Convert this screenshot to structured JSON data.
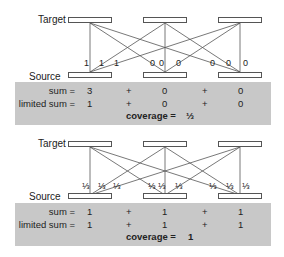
{
  "labels": {
    "target": "Target",
    "source": "Source",
    "sum": "sum =",
    "limited_sum": "limited sum =",
    "coverage": "coverage =",
    "plus": "+"
  },
  "panels": [
    {
      "weights": [
        "1",
        "1",
        "1",
        "0",
        "0",
        "0",
        "0",
        "0",
        "0"
      ],
      "sum": [
        "3",
        "0",
        "0"
      ],
      "limited_sum": [
        "1",
        "0",
        "0"
      ],
      "coverage": "⅓"
    },
    {
      "weights": [
        "⅓",
        "⅓",
        "⅓",
        "⅓",
        "⅓",
        "⅓",
        "⅓",
        "⅓",
        "⅓"
      ],
      "sum": [
        "1",
        "1",
        "1"
      ],
      "limited_sum": [
        "1",
        "1",
        "1"
      ],
      "coverage": "1"
    }
  ],
  "colors": {
    "band": "#c8c8c8",
    "line": "#555555"
  }
}
